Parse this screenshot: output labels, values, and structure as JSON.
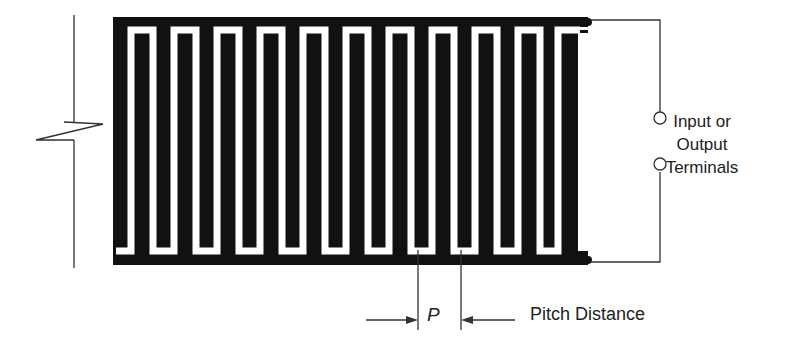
{
  "diagram": {
    "type": "interdigital transducer",
    "labels": {
      "terminals_line1": "Input or",
      "terminals_line2": "Output",
      "terminals_line3": "Terminals",
      "pitch_symbol": "P",
      "pitch_description": "Pitch Distance"
    },
    "colors": {
      "electrode": "#111111",
      "background": "#ffffff",
      "line": "#333333"
    },
    "geometry": {
      "finger_pitch_px": 43,
      "upper_finger_count": 11,
      "lower_finger_count": 10
    }
  }
}
